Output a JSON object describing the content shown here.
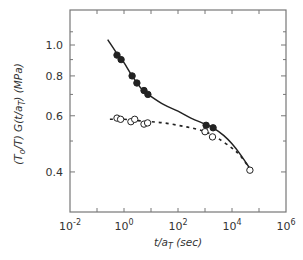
{
  "chart_data": {
    "type": "scatter",
    "title": "",
    "xlabel": "t/a_T (sec)",
    "ylabel": "(T_o/T) G(t/a_T) (MPa)",
    "xscale": "log",
    "yscale": "log",
    "xlim": [
      0.01,
      1000000
    ],
    "ylim": [
      0.34,
      1.2
    ],
    "grid": false,
    "legend": null,
    "x_ticks": [
      {
        "value": 0.01,
        "base": "10",
        "exp": "-2"
      },
      {
        "value": 1,
        "base": "10",
        "exp": "0"
      },
      {
        "value": 100,
        "base": "10",
        "exp": "2"
      },
      {
        "value": 10000,
        "base": "10",
        "exp": "4"
      },
      {
        "value": 1000000,
        "base": "10",
        "exp": "6"
      }
    ],
    "y_ticks": [
      {
        "value": 1.0,
        "label": "1.0"
      },
      {
        "value": 0.8,
        "label": "0.8"
      },
      {
        "value": 0.6,
        "label": "0.6"
      },
      {
        "value": 0.4,
        "label": "0.4"
      }
    ],
    "series": [
      {
        "name": "filled circles (solid fit)",
        "marker": "filled-circle",
        "x": [
          0.55,
          0.78,
          2.0,
          3.0,
          5.5,
          7.7,
          1100,
          2000
        ],
        "y": [
          0.93,
          0.9,
          0.8,
          0.76,
          0.72,
          0.7,
          0.56,
          0.55
        ]
      },
      {
        "name": "open circles (dashed fit)",
        "marker": "open-circle",
        "x": [
          0.55,
          0.75,
          1.8,
          2.5,
          5.5,
          7.5,
          1000,
          1900,
          46000
        ],
        "y": [
          0.59,
          0.585,
          0.575,
          0.585,
          0.565,
          0.57,
          0.535,
          0.515,
          0.405
        ]
      },
      {
        "name": "solid curve",
        "line": "solid",
        "x": [
          0.25,
          0.55,
          1,
          2,
          5,
          10,
          30,
          100,
          300,
          1000,
          2000,
          5000,
          10000,
          20000,
          46000
        ],
        "y": [
          1.04,
          0.94,
          0.88,
          0.8,
          0.72,
          0.69,
          0.65,
          0.62,
          0.59,
          0.565,
          0.55,
          0.52,
          0.49,
          0.455,
          0.41
        ]
      },
      {
        "name": "dashed curve",
        "line": "dashed",
        "x": [
          0.3,
          1,
          3,
          10,
          30,
          100,
          300,
          1000,
          3000,
          10000,
          20000,
          46000
        ],
        "y": [
          0.585,
          0.585,
          0.58,
          0.575,
          0.57,
          0.56,
          0.55,
          0.535,
          0.51,
          0.475,
          0.45,
          0.41
        ]
      }
    ]
  }
}
